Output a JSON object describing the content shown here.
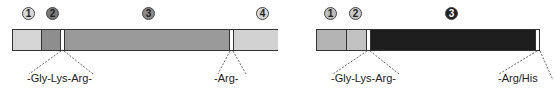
{
  "diagrams": [
    {
      "name": "precursor-left",
      "domains": [
        {
          "badge": "1",
          "badge_fill": "#d8d8d8",
          "badge_text": "#222222",
          "fill": "#d6d6d6"
        },
        {
          "badge": "2",
          "badge_fill": "#7a7a7a",
          "badge_text": "#111111",
          "fill": "#8e8e8e"
        },
        {
          "badge": "3",
          "badge_fill": "#8a8a8a",
          "badge_text": "#111111",
          "fill": "#9a9a9a"
        },
        {
          "badge": "4",
          "badge_fill": "#d8d8d8",
          "badge_text": "#222222",
          "fill": "#d2d2d2"
        }
      ],
      "cleavage_labels": [
        "-Gly-Lys-Arg-",
        "-Arg-"
      ]
    },
    {
      "name": "precursor-right",
      "domains": [
        {
          "badge": "1",
          "badge_fill": "#bdbdbd",
          "badge_text": "#222222",
          "fill": "#b4b4b4"
        },
        {
          "badge": "2",
          "badge_fill": "#c8c8c8",
          "badge_text": "#222222",
          "fill": "#c2c2c2"
        },
        {
          "badge": "3",
          "badge_fill": "#222222",
          "badge_text": "#ffffff",
          "fill": "#1e1e1e"
        }
      ],
      "cleavage_labels": [
        "-Gly-Lys-Arg-",
        "-Arg/His"
      ]
    }
  ]
}
